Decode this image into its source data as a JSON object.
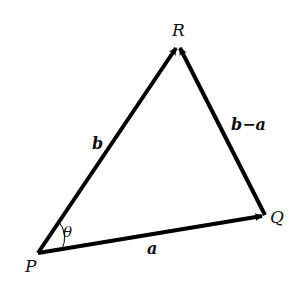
{
  "diagram": {
    "type": "vector-triangle",
    "points": {
      "P": {
        "label": "P",
        "x": 38,
        "y": 253
      },
      "Q": {
        "label": "Q",
        "x": 265,
        "y": 215
      },
      "R": {
        "label": "R",
        "x": 178,
        "y": 45
      }
    },
    "vectors": [
      {
        "id": "a",
        "label": "a",
        "from": "P",
        "to": "Q"
      },
      {
        "id": "b",
        "label": "b",
        "from": "P",
        "to": "R"
      },
      {
        "id": "b_minus_a",
        "label": "b−a",
        "from": "Q",
        "to": "R"
      }
    ],
    "angle": {
      "label": "θ",
      "vertex": "P"
    },
    "colors": {
      "stroke": "#000000",
      "text": "#111111",
      "background": "#ffffff"
    }
  }
}
